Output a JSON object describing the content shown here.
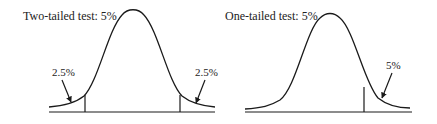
{
  "diagrams": [
    {
      "title": "Two-tailed test: 5%",
      "left_tail_label": "2.5%",
      "right_tail_label": "2.5%"
    },
    {
      "title": "One-tailed test: 5%",
      "right_tail_label": "5%"
    }
  ],
  "colors": {
    "line": "#1a1a1a",
    "text": "#222222",
    "background": "#ffffff"
  }
}
